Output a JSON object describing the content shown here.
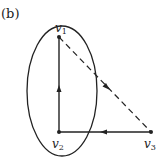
{
  "figure_label": "(b)",
  "nodes": [
    {
      "id": "v1",
      "label": "v",
      "sub": "1",
      "x": 59,
      "y": 37
    },
    {
      "id": "v2",
      "label": "v",
      "sub": "2",
      "x": 59,
      "y": 132
    },
    {
      "id": "v3",
      "label": "v",
      "sub": "3",
      "x": 151,
      "y": 132
    }
  ],
  "edges": [
    {
      "from": "v2",
      "to": "v1",
      "style": "solid",
      "directed": true
    },
    {
      "from": "v3",
      "to": "v2",
      "style": "solid",
      "directed": true
    },
    {
      "from": "v1",
      "to": "v3",
      "style": "dashed",
      "directed": true
    }
  ],
  "grouping": {
    "shape": "ellipse",
    "contains": [
      "v1",
      "v2"
    ]
  },
  "colors": {
    "stroke": "#222222",
    "background": "#ffffff"
  }
}
